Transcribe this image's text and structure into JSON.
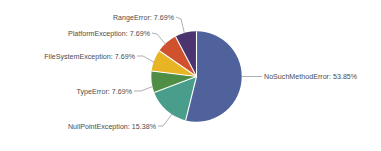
{
  "chart_data": {
    "type": "pie",
    "title": "",
    "subtitle": "",
    "xlabel": "",
    "ylabel": "",
    "grid": false,
    "legend_position": "none",
    "label_format": "{name}: {percent}%",
    "start_angle_deg": 0,
    "direction": "clockwise",
    "background_color": "#ffffff",
    "separator_color": "#ffffff",
    "leader_line_color": "#8c8c8c",
    "label_text_color": "#4c4c4c",
    "categories": [
      "NoSuchMethodError",
      "NullPointException",
      "TypeError",
      "FileSystemException",
      "PlatformException",
      "RangeError"
    ],
    "values": [
      53.85,
      15.38,
      7.69,
      7.69,
      7.69,
      7.69
    ],
    "colors": [
      "#4f629b",
      "#499e8b",
      "#4f8f45",
      "#e9b424",
      "#d0512e",
      "#4b3470"
    ],
    "slices": [
      {
        "name": "NoSuchMethodError",
        "percent": 53.85,
        "label": "NoSuchMethodError: 53.85%",
        "color": "#4f629b"
      },
      {
        "name": "NullPointException",
        "percent": 15.38,
        "label": "NullPointException: 15.38%",
        "color": "#499e8b"
      },
      {
        "name": "TypeError",
        "percent": 7.69,
        "label": "TypeError: 7.69%",
        "color": "#4f8f45"
      },
      {
        "name": "FileSystemException",
        "percent": 7.69,
        "label": "FileSystemException: 7.69%",
        "color": "#e9b424"
      },
      {
        "name": "PlatformException",
        "percent": 7.69,
        "label": "PlatformException: 7.69%",
        "color": "#d0512e"
      },
      {
        "name": "RangeError",
        "percent": 7.69,
        "label": "RangeError: 7.69%",
        "color": "#4b3470"
      }
    ]
  }
}
